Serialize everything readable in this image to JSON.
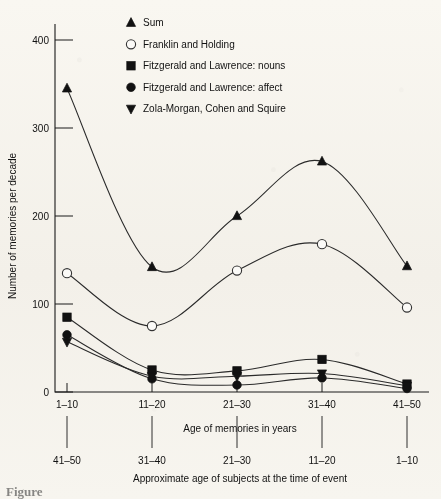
{
  "figure": {
    "caption_partial": "Figure"
  },
  "chart_data": {
    "type": "line",
    "title": "",
    "xlabel": "Age of memories in years",
    "ylabel": "Number of memories per decade",
    "secondary_xlabel": "Approximate age of subjects at the time of event",
    "categories": [
      "1–10",
      "11–20",
      "21–30",
      "31–40",
      "41–50"
    ],
    "secondary_categories": [
      "41–50",
      "31–40",
      "21–30",
      "11–20",
      "1–10"
    ],
    "ylim": [
      0,
      430
    ],
    "yticks": [
      0,
      100,
      200,
      300,
      400
    ],
    "ytick_labels": [
      "0",
      "100",
      "200",
      "300",
      "400"
    ],
    "grid": false,
    "legend_position": "top-center",
    "series": [
      {
        "name": "Sum",
        "marker": "triangle-up",
        "filled": true,
        "values": [
          345,
          142,
          200,
          262,
          143
        ]
      },
      {
        "name": "Franklin and Holding",
        "marker": "circle-open",
        "filled": false,
        "values": [
          135,
          75,
          138,
          168,
          96
        ]
      },
      {
        "name": "Fitzgerald and Lawrence: nouns",
        "marker": "square",
        "filled": true,
        "values": [
          85,
          25,
          24,
          37,
          9
        ]
      },
      {
        "name": "Fitzgerald and Lawrence: affect",
        "marker": "circle-filled",
        "filled": true,
        "values": [
          65,
          15,
          8,
          16,
          4
        ]
      },
      {
        "name": "Zola-Morgan, Cohen and Squire",
        "marker": "triangle-down",
        "filled": true,
        "values": [
          57,
          18,
          18,
          21,
          7
        ]
      }
    ]
  }
}
